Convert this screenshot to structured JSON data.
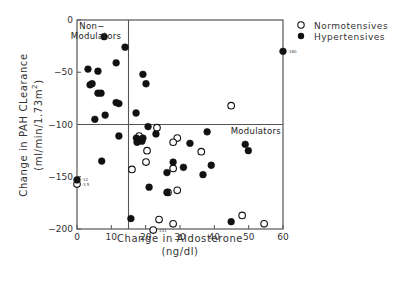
{
  "chart_data": {
    "type": "scatter",
    "title": "",
    "xlabel": "Change in Aldosterone",
    "xlabel_units": "(ng/dl)",
    "ylabel": "Change in PAH CLearance",
    "ylabel_units": "(ml/min/1.73m²)",
    "xlim": [
      0,
      60
    ],
    "ylim": [
      -200,
      0
    ],
    "xticks": [
      0,
      10,
      20,
      30,
      40,
      50,
      60
    ],
    "yticks": [
      0,
      -50,
      -100,
      -150,
      -200
    ],
    "grid": false,
    "legend_position": "top-right outside",
    "reference_lines": {
      "vertical_x": 15,
      "horizontal_y": -100
    },
    "region_labels": [
      {
        "text": "Non-\nModulators",
        "position": "top-left quadrant"
      },
      {
        "text": "Modulators",
        "position": "right of horizontal line"
      }
    ],
    "annotations": [
      {
        "text": "-180",
        "x": 60,
        "y": -30
      },
      {
        "text": "-12",
        "x": 0,
        "y": -153
      },
      {
        "text": "-3.5",
        "x": 0,
        "y": -157
      },
      {
        "text": "-241",
        "x": 22.2,
        "y": -201
      }
    ],
    "series": [
      {
        "name": "Normotensives",
        "marker": "open-circle",
        "points": [
          [
            23.3,
            -103
          ],
          [
            18.1,
            -111
          ],
          [
            29.2,
            -113
          ],
          [
            28,
            -117
          ],
          [
            20.4,
            -125
          ],
          [
            36.2,
            -126
          ],
          [
            20.1,
            -136
          ],
          [
            16,
            -143
          ],
          [
            28,
            -142
          ],
          [
            29.2,
            -163
          ],
          [
            26.5,
            -165
          ],
          [
            44.9,
            -82
          ],
          [
            23.9,
            -191
          ],
          [
            28,
            -195
          ],
          [
            22.2,
            -201
          ],
          [
            48.1,
            -187
          ],
          [
            54.5,
            -195
          ],
          [
            0,
            -157
          ]
        ]
      },
      {
        "name": "Hypertensives",
        "marker": "filled-circle",
        "points": [
          [
            7.9,
            -16
          ],
          [
            14,
            -26
          ],
          [
            11.4,
            -41
          ],
          [
            3.2,
            -47
          ],
          [
            6.1,
            -49
          ],
          [
            19.2,
            -52
          ],
          [
            20.1,
            -61
          ],
          [
            4.4,
            -61
          ],
          [
            3.8,
            -62
          ],
          [
            6.1,
            -70
          ],
          [
            7.0,
            -70
          ],
          [
            11.4,
            -79
          ],
          [
            12.2,
            -80
          ],
          [
            8.2,
            -91
          ],
          [
            5.2,
            -95
          ],
          [
            17.2,
            -89
          ],
          [
            20.7,
            -102
          ],
          [
            12.2,
            -111
          ],
          [
            23,
            -109
          ],
          [
            17.3,
            -113
          ],
          [
            18.2,
            -115
          ],
          [
            17.5,
            -117
          ],
          [
            18.9,
            -116
          ],
          [
            19.2,
            -113
          ],
          [
            32.9,
            -118
          ],
          [
            37.9,
            -107
          ],
          [
            49,
            -119
          ],
          [
            49.9,
            -125
          ],
          [
            28,
            -136
          ],
          [
            31,
            -141
          ],
          [
            39.1,
            -139
          ],
          [
            26.2,
            -146
          ],
          [
            36.7,
            -148
          ],
          [
            7.2,
            -135
          ],
          [
            21,
            -160
          ],
          [
            26.2,
            -165
          ],
          [
            15.7,
            -190
          ],
          [
            44.9,
            -193
          ],
          [
            60,
            -30
          ],
          [
            0,
            -153
          ]
        ]
      }
    ]
  },
  "legend": {
    "items": [
      {
        "label": "Normotensives",
        "marker": "open-circle"
      },
      {
        "label": "Hypertensives",
        "marker": "filled-circle"
      }
    ]
  },
  "labels": {
    "xlabel": "Change in Aldosterone",
    "xlabel_units": "(ng/dl)",
    "ylabel": "Change in PAH CLearance",
    "ylabel_units": "(ml/min/1.73m",
    "ylabel_sup": "2",
    "ylabel_close": ")",
    "nonmod_line1": "Non−",
    "nonmod_line2": "Modulators",
    "modulators": "Modulators"
  },
  "colors": {
    "axis": "#555555",
    "marker": "#111111",
    "text": "#333333"
  }
}
